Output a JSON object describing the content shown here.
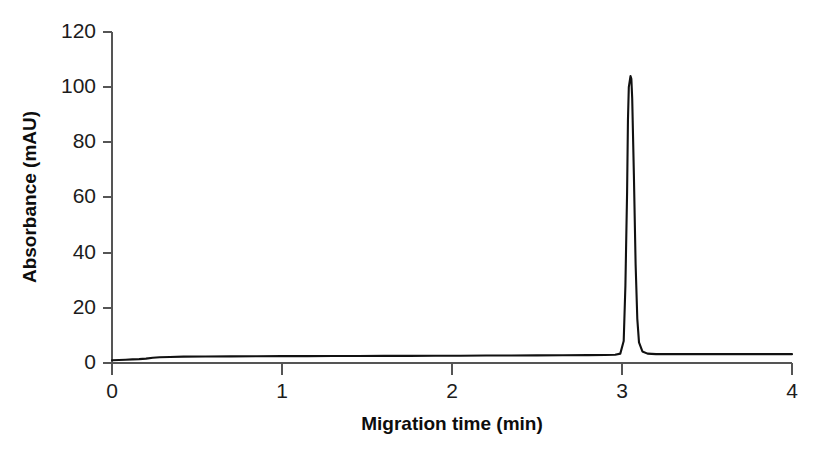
{
  "chart_data": {
    "type": "line",
    "title": "",
    "subtitle": "",
    "xlabel": "Migration time (min)",
    "ylabel": "Absorbance (mAU)",
    "xlim": [
      0,
      4
    ],
    "ylim": [
      0,
      120
    ],
    "xticks": [
      0,
      1,
      2,
      3,
      4
    ],
    "xtick_labels": [
      "0",
      "1",
      "2",
      "3",
      "4"
    ],
    "yticks": [
      0,
      20,
      40,
      60,
      80,
      100,
      120
    ],
    "ytick_labels": [
      "0",
      "20",
      "40",
      "60",
      "80",
      "100",
      "120"
    ],
    "grid": false,
    "legend": null,
    "legend_position": "none",
    "annotations": [],
    "line_color": "#111111",
    "axis_color": "#555555",
    "background_color": "#ffffff",
    "series": [
      {
        "name": "Electropherogram trace",
        "x": [
          0.0,
          0.04,
          0.08,
          0.12,
          0.16,
          0.2,
          0.24,
          0.28,
          0.34,
          0.42,
          0.55,
          0.7,
          0.85,
          1.0,
          1.15,
          1.3,
          1.45,
          1.6,
          1.75,
          1.9,
          2.05,
          2.2,
          2.35,
          2.5,
          2.65,
          2.8,
          2.9,
          2.96,
          2.99,
          3.01,
          3.02,
          3.03,
          3.035,
          3.04,
          3.05,
          3.055,
          3.06,
          3.07,
          3.08,
          3.09,
          3.1,
          3.12,
          3.15,
          3.2,
          3.3,
          3.45,
          3.6,
          3.75,
          3.9,
          4.0
        ],
        "y": [
          1.0,
          1.1,
          1.2,
          1.3,
          1.4,
          1.6,
          1.9,
          2.1,
          2.2,
          2.3,
          2.35,
          2.4,
          2.45,
          2.5,
          2.5,
          2.55,
          2.55,
          2.6,
          2.6,
          2.65,
          2.65,
          2.7,
          2.7,
          2.75,
          2.8,
          2.85,
          2.9,
          3.0,
          3.4,
          8.0,
          28.0,
          62.0,
          88.0,
          100.0,
          104.0,
          103.0,
          96.0,
          68.0,
          36.0,
          16.0,
          7.5,
          4.2,
          3.4,
          3.2,
          3.2,
          3.2,
          3.2,
          3.2,
          3.2,
          3.2
        ]
      }
    ],
    "peak": {
      "migration_time_min": 3.05,
      "height_mau": 104
    }
  }
}
